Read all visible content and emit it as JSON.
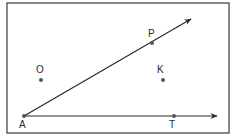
{
  "diagram": {
    "type": "geometry-angle",
    "frame": {
      "x": 7,
      "y": 3,
      "width": 222,
      "height": 130,
      "stroke": "#3a3a3a"
    },
    "vertex": {
      "label": "A",
      "x": 24,
      "y": 116
    },
    "rays": [
      {
        "name": "ray-AP",
        "from": "A",
        "to": {
          "x": 191,
          "y": 19
        },
        "through": "P"
      },
      {
        "name": "ray-AT",
        "from": "A",
        "to": {
          "x": 217,
          "y": 116
        },
        "through": "T"
      }
    ],
    "points": [
      {
        "label": "A",
        "x": 24,
        "y": 116,
        "label_x": 19,
        "label_y": 128
      },
      {
        "label": "P",
        "x": 152,
        "y": 43,
        "label_x": 148,
        "label_y": 37
      },
      {
        "label": "O",
        "x": 41,
        "y": 80,
        "label_x": 36,
        "label_y": 73
      },
      {
        "label": "K",
        "x": 163,
        "y": 80,
        "label_x": 157,
        "label_y": 73
      },
      {
        "label": "T",
        "x": 174,
        "y": 116,
        "label_x": 169,
        "label_y": 128
      }
    ],
    "colors": {
      "line": "#2a2a2a",
      "point": "#555555"
    }
  }
}
